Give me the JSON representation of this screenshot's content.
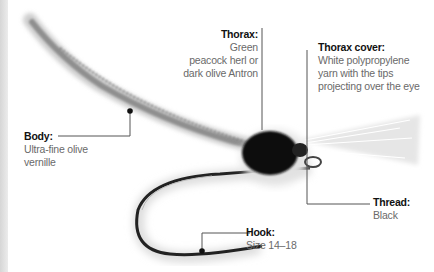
{
  "labels": {
    "body": {
      "title": "Body:",
      "lines": [
        "Ultra-fine olive",
        "vernille"
      ]
    },
    "thorax": {
      "title": "Thorax:",
      "lines": [
        "Green",
        "peacock herl or",
        "dark olive Antron"
      ]
    },
    "thorax_cover": {
      "title": "Thorax cover:",
      "lines": [
        "White polypropylene",
        "yarn with the tips",
        "projecting over the eye"
      ]
    },
    "thread": {
      "title": "Thread:",
      "lines": [
        "Black"
      ]
    },
    "hook": {
      "title": "Hook:",
      "lines": [
        "Size 14–18"
      ]
    }
  },
  "colors": {
    "leader": "#555555",
    "dot": "#111111",
    "body": "#8a8a8a",
    "thorax": "#111111"
  }
}
